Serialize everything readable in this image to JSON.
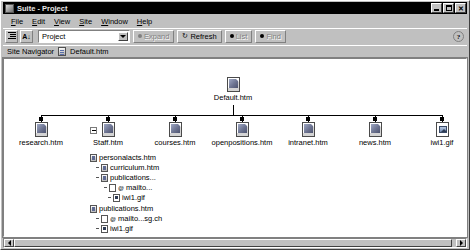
{
  "window": {
    "title": "Suite - Project",
    "icon": "app-icon",
    "controls": [
      {
        "name": "minimize",
        "glyph": "_"
      },
      {
        "name": "maximize",
        "glyph": "□"
      },
      {
        "name": "close",
        "glyph": "✕"
      }
    ]
  },
  "menu": {
    "items": [
      {
        "label": "File",
        "accel": "F"
      },
      {
        "label": "Edit",
        "accel": "E"
      },
      {
        "label": "View",
        "accel": "V"
      },
      {
        "label": "Site",
        "accel": "S"
      },
      {
        "label": "Window",
        "accel": "W"
      },
      {
        "label": "Help",
        "accel": "H"
      }
    ]
  },
  "toolbar": {
    "outline_icon": "outline-view-icon",
    "sort_icon": "sort-az-icon",
    "combo_value": "Project",
    "combo_arrow_icon": "chevron-down-icon",
    "expand_label": "Expand",
    "refresh_label": "Refresh",
    "list_label": "List",
    "find_label": "Find",
    "help_label": "?"
  },
  "navstrip": {
    "title": "Site Navigator",
    "doc_icon": "document-icon",
    "document": "Default.htm"
  },
  "tree": {
    "root": {
      "label": "Default.htm",
      "icon": "html-page-icon"
    },
    "children": [
      {
        "label": "research.htm",
        "icon": "html-page-icon",
        "expander": null
      },
      {
        "label": "Staff.htm",
        "icon": "html-page-icon",
        "expander": "minus"
      },
      {
        "label": "courses.htm",
        "icon": "html-page-icon",
        "expander": null
      },
      {
        "label": "openpositions.htm",
        "icon": "html-page-icon",
        "expander": null
      },
      {
        "label": "intranet.htm",
        "icon": "html-page-icon",
        "expander": null
      },
      {
        "label": "news.htm",
        "icon": "html-page-icon",
        "expander": null
      },
      {
        "label": "iwi1.gif",
        "icon": "image-file-icon",
        "expander": null
      }
    ],
    "outline": [
      {
        "label": "personalacts.htm",
        "icon": "html-page-icon",
        "depth": 0
      },
      {
        "label": "curriculum.htm",
        "icon": "html-page-icon",
        "depth": 1
      },
      {
        "label": "publications...",
        "icon": "html-page-icon",
        "depth": 1
      },
      {
        "label": "mailto...",
        "icon": "mail-link-icon",
        "depth": 2
      },
      {
        "label": "iwi1.gif",
        "icon": "image-file-icon",
        "depth": 2
      },
      {
        "label": "publications.htm",
        "icon": "html-page-icon",
        "depth": 0
      },
      {
        "label": "mailto...sg.ch",
        "icon": "mail-link-icon",
        "depth": 1
      },
      {
        "label": "iwi1.gif",
        "icon": "image-file-icon",
        "depth": 1
      }
    ]
  },
  "scrollbar": {
    "left_arrow_icon": "arrow-left-icon",
    "right_arrow_icon": "arrow-right-icon"
  },
  "colors": {
    "chrome": "#c0c0c0",
    "titlebar": "#000000",
    "canvas": "#ffffff",
    "shadow": "#808080",
    "highlight": "#ffffff"
  }
}
